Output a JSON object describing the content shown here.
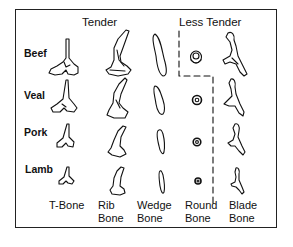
{
  "headers": {
    "tender": "Tender",
    "less_tender": "Less Tender"
  },
  "rows": [
    {
      "label": "Beef"
    },
    {
      "label": "Veal"
    },
    {
      "label": "Pork"
    },
    {
      "label": "Lamb"
    }
  ],
  "columns": [
    {
      "line1": "T-Bone",
      "line2": ""
    },
    {
      "line1": "Rib",
      "line2": "Bone"
    },
    {
      "line1": "Wedge",
      "line2": "Bone"
    },
    {
      "line1": "Round",
      "line2": "Bone"
    },
    {
      "line1": "Blade",
      "line2": "Bone"
    }
  ],
  "colors": {
    "ink": "#111111",
    "background": "#ffffff"
  }
}
